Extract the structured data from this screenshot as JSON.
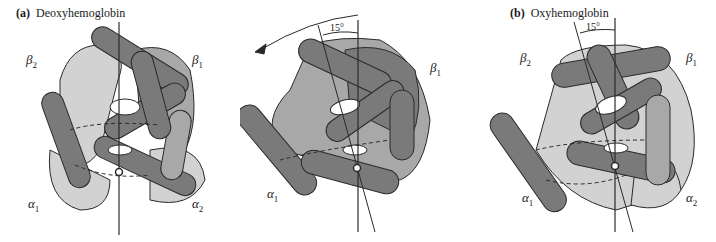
{
  "figure": {
    "panel_a": {
      "letter": "(a)",
      "title": "Deoxyhemoglobin",
      "subunits": {
        "beta2": "β",
        "beta2_sub": "2",
        "beta1": "β",
        "beta1_sub": "1",
        "alpha1": "α",
        "alpha1_sub": "1",
        "alpha2": "α",
        "alpha2_sub": "2"
      }
    },
    "panel_middle": {
      "angle": "15°",
      "subunits": {
        "beta1": "β",
        "beta1_sub": "1",
        "alpha1": "α",
        "alpha1_sub": "1"
      }
    },
    "panel_b": {
      "letter": "(b)",
      "title": "Oxyhemoglobin",
      "angle": "15°",
      "subunits": {
        "beta2": "β",
        "beta2_sub": "2",
        "beta1": "β",
        "beta1_sub": "1",
        "alpha1": "α",
        "alpha1_sub": "1",
        "alpha2": "α",
        "alpha2_sub": "2"
      }
    },
    "colors": {
      "dark": "#7a7a7a",
      "mid": "#a8a8a8",
      "light": "#d2d2d2",
      "outline": "#2a2a2a"
    }
  }
}
